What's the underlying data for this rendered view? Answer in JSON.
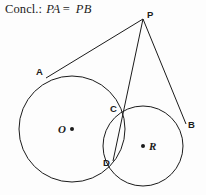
{
  "figure": {
    "width": 206,
    "height": 195,
    "background_color": "#fdfdfd",
    "stroke_color": "#1b1b1b",
    "text_color": "#1b1b1b"
  },
  "conclusion": {
    "prefix": "Concl.:",
    "left_term": "PA",
    "equals": "=",
    "right_term": "PB",
    "full_text": "Concl.: PA = PB"
  },
  "points": [
    {
      "id": "P",
      "label": "P",
      "x": 143,
      "y": 19,
      "label_x": 147,
      "label_y": 10
    },
    {
      "id": "A",
      "label": "A",
      "x": 47,
      "y": 77,
      "label_x": 36,
      "label_y": 67
    },
    {
      "id": "B",
      "label": "B",
      "x": 185,
      "y": 122,
      "label_x": 188,
      "label_y": 120
    },
    {
      "id": "C",
      "label": "C",
      "x": 120,
      "y": 113,
      "label_x": 110,
      "label_y": 104
    },
    {
      "id": "D",
      "label": "D",
      "x": 114,
      "y": 159,
      "label_x": 103,
      "label_y": 158
    }
  ],
  "centers": [
    {
      "id": "O",
      "label": "O",
      "dot_x": 72,
      "dot_y": 129,
      "label_x": 58,
      "label_y": 124,
      "label_side": "left"
    },
    {
      "id": "R",
      "label": "R",
      "dot_x": 143,
      "dot_y": 146,
      "label_x": 149,
      "label_y": 141,
      "label_side": "right"
    }
  ],
  "circles": [
    {
      "id": "circle-O",
      "center_label": "O",
      "cx": 72,
      "cy": 129,
      "r": 53
    },
    {
      "id": "circle-R",
      "center_label": "R",
      "cx": 143,
      "cy": 146,
      "r": 40
    }
  ],
  "segments": [
    {
      "id": "PA",
      "from": "P",
      "to": "A"
    },
    {
      "id": "PD",
      "from": "P",
      "to": "D"
    },
    {
      "id": "PB",
      "from": "P",
      "to": "B"
    }
  ]
}
